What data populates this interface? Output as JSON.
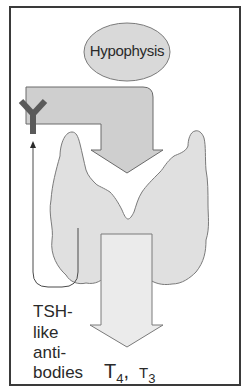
{
  "diagram": {
    "nodes": {
      "hypophysis": {
        "label": "Hypophysis",
        "shape": "ellipse",
        "color": "#d9d9d9"
      },
      "thyroid": {
        "label": "",
        "shape": "thyroid-gland",
        "color": "#e0e0e0"
      },
      "antibody": {
        "label": "",
        "shape": "Y-antibody",
        "color": "#5a5a5a"
      }
    },
    "arrows": [
      {
        "from": "hypophysis",
        "to": "thyroid",
        "style": "bent-block-arrow",
        "color": "#cfcfcf"
      },
      {
        "from": "thyroid",
        "to": "hormones",
        "style": "block-arrow",
        "color": "#ebebeb"
      },
      {
        "from": "thyroid",
        "to": "antibody",
        "style": "thin-loop-arrow",
        "color": "#3a3a3a"
      }
    ],
    "labels": {
      "antibodies": [
        "TSH-",
        "like",
        "anti-",
        "bodies"
      ],
      "hormone_t4": {
        "base": "T",
        "sub": "4",
        "sep": ","
      },
      "hormone_t3": {
        "base": "T",
        "sub": "3"
      }
    }
  }
}
